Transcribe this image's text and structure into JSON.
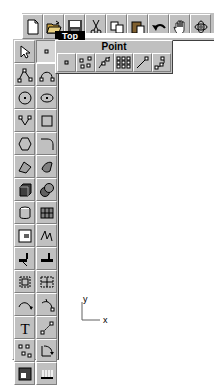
{
  "toolbar": {
    "buttons": [
      {
        "name": "new-file",
        "icon": "new-file-icon"
      },
      {
        "name": "open-file",
        "icon": "open-folder-icon"
      },
      {
        "name": "save-file",
        "icon": "save-disk-icon"
      },
      {
        "name": "cut",
        "icon": "scissors-icon"
      },
      {
        "name": "copy",
        "icon": "copy-icon"
      },
      {
        "name": "paste",
        "icon": "paste-icon"
      },
      {
        "name": "undo",
        "icon": "undo-arrow-icon"
      },
      {
        "name": "pan",
        "icon": "hand-icon"
      },
      {
        "name": "rotate-view",
        "icon": "rotate-view-icon"
      }
    ]
  },
  "viewport": {
    "title": "Top",
    "axis": {
      "x_label": "x",
      "y_label": "y"
    }
  },
  "flyout": {
    "title": "Point",
    "buttons": [
      {
        "name": "single-point",
        "icon": "point-icon"
      },
      {
        "name": "multiple-points",
        "icon": "multi-point-icon"
      },
      {
        "name": "divide-curve-points",
        "icon": "curve-points-icon"
      },
      {
        "name": "point-grid",
        "icon": "point-grid-icon"
      },
      {
        "name": "line-end-point",
        "icon": "line-point-icon"
      },
      {
        "name": "curve-control-points",
        "icon": "curve-control-points-icon"
      }
    ]
  },
  "left_toolbar": {
    "buttons": [
      {
        "name": "select",
        "icon": "arrow-cursor-icon"
      },
      {
        "name": "point",
        "icon": "point-icon",
        "active": true
      },
      {
        "name": "polyline",
        "icon": "polyline-icon"
      },
      {
        "name": "curve",
        "icon": "curve-icon"
      },
      {
        "name": "circle",
        "icon": "circle-icon"
      },
      {
        "name": "ellipse",
        "icon": "ellipse-icon"
      },
      {
        "name": "arc",
        "icon": "arc-icon"
      },
      {
        "name": "rectangle",
        "icon": "rectangle-icon"
      },
      {
        "name": "polygon",
        "icon": "polygon-icon"
      },
      {
        "name": "fillet",
        "icon": "fillet-icon"
      },
      {
        "name": "surface-from-points",
        "icon": "surface-icon"
      },
      {
        "name": "loft-surface",
        "icon": "loft-surface-icon"
      },
      {
        "name": "box-solid",
        "icon": "box-icon"
      },
      {
        "name": "sphere-solid",
        "icon": "sphere-icon"
      },
      {
        "name": "cylinder-solid",
        "icon": "cylinder-icon"
      },
      {
        "name": "mesh",
        "icon": "mesh-icon"
      },
      {
        "name": "trim",
        "icon": "trim-icon"
      },
      {
        "name": "split",
        "icon": "split-icon"
      },
      {
        "name": "extend",
        "icon": "extend-icon"
      },
      {
        "name": "offset",
        "icon": "offset-icon"
      },
      {
        "name": "group",
        "icon": "group-icon"
      },
      {
        "name": "ungroup",
        "icon": "ungroup-icon"
      },
      {
        "name": "dimension-arc",
        "icon": "dimension-arc-icon"
      },
      {
        "name": "dimension-radius",
        "icon": "dimension-radius-icon"
      },
      {
        "name": "text",
        "icon": "text-T-icon"
      },
      {
        "name": "scale",
        "icon": "scale-icon"
      },
      {
        "name": "array",
        "icon": "array-icon"
      },
      {
        "name": "rotate",
        "icon": "rotate-icon"
      },
      {
        "name": "render",
        "icon": "render-icon"
      },
      {
        "name": "properties-table",
        "icon": "properties-icon"
      }
    ]
  }
}
